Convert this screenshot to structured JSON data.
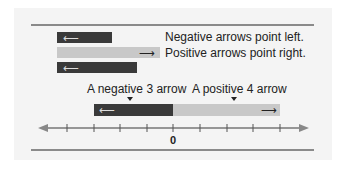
{
  "legend": {
    "negative_label": "Negative arrows point left.",
    "positive_label": "Positive arrows point right."
  },
  "labels": {
    "negative_arrow": "A negative 3 arrow",
    "positive_arrow": "A positive 4 arrow"
  },
  "number_line": {
    "zero_label": "0",
    "tick_count": 9
  },
  "colors": {
    "negative": "#3a3a3a",
    "positive": "#c8c8c8"
  }
}
